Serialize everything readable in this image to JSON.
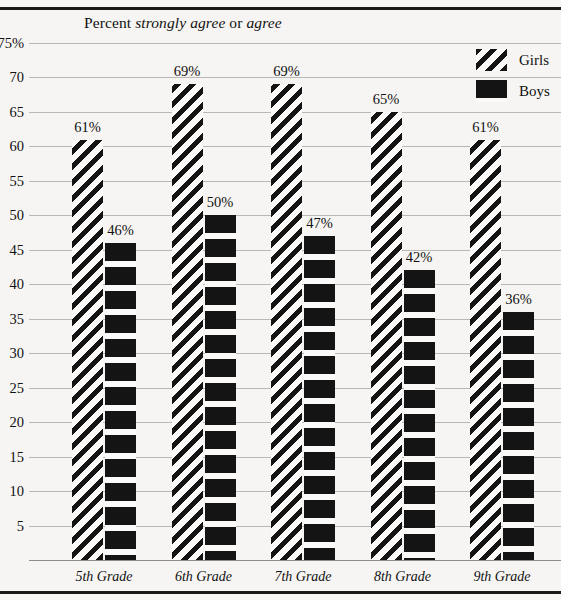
{
  "chart_data": {
    "type": "bar",
    "title": "Percent strongly agree or agree",
    "title_parts": [
      {
        "text": "Percent ",
        "italic": false
      },
      {
        "text": "strongly agree",
        "italic": true
      },
      {
        "text": " or ",
        "italic": false
      },
      {
        "text": "agree",
        "italic": true
      }
    ],
    "xlabel": "",
    "ylabel": "",
    "ylim": [
      0,
      75
    ],
    "grid": true,
    "legend_position": "top-right",
    "categories": [
      "5th Grade",
      "6th Grade",
      "7th Grade",
      "8th Grade",
      "9th Grade"
    ],
    "series": [
      {
        "name": "Girls",
        "pattern": "diagonal-stripes",
        "values": [
          61,
          69,
          69,
          65,
          61
        ],
        "labels": [
          "61%",
          "69%",
          "69%",
          "65%",
          "61%"
        ]
      },
      {
        "name": "Boys",
        "pattern": "horizontal-bands",
        "values": [
          46,
          50,
          47,
          42,
          36
        ],
        "labels": [
          "46%",
          "50%",
          "47%",
          "42%",
          "36%"
        ]
      }
    ],
    "yticks": [
      {
        "value": 75,
        "label": "75%"
      },
      {
        "value": 70,
        "label": "70"
      },
      {
        "value": 65,
        "label": "65"
      },
      {
        "value": 60,
        "label": "60"
      },
      {
        "value": 55,
        "label": "55"
      },
      {
        "value": 50,
        "label": "50"
      },
      {
        "value": 45,
        "label": "45"
      },
      {
        "value": 40,
        "label": "40"
      },
      {
        "value": 35,
        "label": "35"
      },
      {
        "value": 30,
        "label": "30"
      },
      {
        "value": 25,
        "label": "25"
      },
      {
        "value": 20,
        "label": "20"
      },
      {
        "value": 15,
        "label": "15"
      },
      {
        "value": 10,
        "label": "10"
      },
      {
        "value": 5,
        "label": "5"
      }
    ],
    "colors": {
      "ink": "#141414",
      "background": "#f6f5f3",
      "gridline": "#b9b8b6",
      "rule": "#1a1a1a"
    }
  }
}
